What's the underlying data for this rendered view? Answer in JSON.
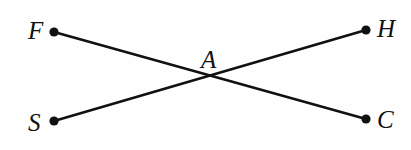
{
  "figure": {
    "kind": "geometry-diagram",
    "width": 411,
    "height": 150,
    "background_color": "#fefefe",
    "stroke_color": "#111111",
    "line_width": 2.6,
    "dot_radius": 4.6,
    "points": [
      {
        "id": "F",
        "label": "F",
        "x": 54,
        "y": 32,
        "label_x": 28,
        "label_y": 18,
        "has_dot": true
      },
      {
        "id": "H",
        "label": "H",
        "x": 366,
        "y": 30,
        "label_x": 377,
        "label_y": 16,
        "has_dot": true
      },
      {
        "id": "S",
        "label": "S",
        "x": 54,
        "y": 121,
        "label_x": 28,
        "label_y": 110,
        "has_dot": true
      },
      {
        "id": "C",
        "label": "C",
        "x": 366,
        "y": 119,
        "label_x": 377,
        "label_y": 107,
        "has_dot": true
      },
      {
        "id": "A",
        "label": "A",
        "x": 209,
        "y": 78,
        "label_x": 201,
        "label_y": 47,
        "has_dot": false
      }
    ],
    "segments": [
      {
        "id": "FC",
        "from": "F",
        "to": "C",
        "x1": 54,
        "y1": 32,
        "x2": 366,
        "y2": 119
      },
      {
        "id": "SH",
        "from": "S",
        "to": "H",
        "x1": 54,
        "y1": 121,
        "x2": 366,
        "y2": 30
      }
    ],
    "intersection": {
      "id": "A",
      "label": "A",
      "x": 209,
      "y": 78
    }
  }
}
